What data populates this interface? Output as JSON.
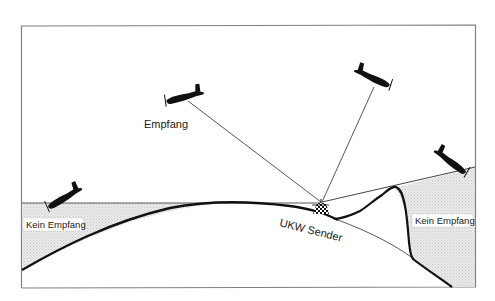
{
  "diagram": {
    "type": "radio-propagation-illustration",
    "labels": {
      "reception": "Empfang",
      "transmitter": "UKW Sender",
      "no_reception_left": "Kein Empfang",
      "no_reception_right": "Kein Empfang"
    },
    "elements": {
      "aircraft_count": 4,
      "aircraft": [
        {
          "id": "plane-1",
          "status": "Empfang"
        },
        {
          "id": "plane-2",
          "status": "Empfang"
        },
        {
          "id": "plane-3",
          "status": "Kein Empfang"
        },
        {
          "id": "plane-4",
          "status": "Kein Empfang"
        }
      ]
    },
    "colors": {
      "frame": "#808080",
      "line": "#333333",
      "ground": "#111111",
      "shadow_fill": "#e4e4e4",
      "aircraft": "#111111"
    }
  }
}
